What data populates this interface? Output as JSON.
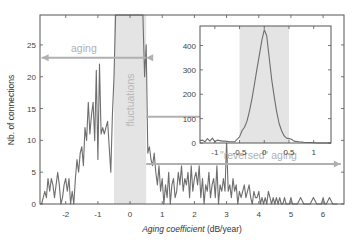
{
  "chart_data": [
    {
      "type": "line",
      "title": "",
      "xlabel": "Aging coefficient (dB/year)",
      "xlabel_italic_part": "Aging coefficient",
      "xlabel_unit_part": "(dB/year)",
      "ylabel": "Nb. of connections",
      "xlim": [
        -2.8,
        6.65
      ],
      "ylim": [
        0,
        29.7
      ],
      "xticks": [
        -2,
        -1,
        0,
        1,
        2,
        3,
        4,
        5,
        6
      ],
      "yticks": [
        0,
        5,
        10,
        15,
        20,
        25
      ],
      "grid": false,
      "line_color": "#6e6e6e",
      "shaded_region": {
        "x0": -0.5,
        "x1": 0.5,
        "color": "#e4e4e4",
        "label": "fluctuations"
      },
      "annotations": [
        {
          "text": "aging",
          "arrow": "left",
          "x_from": 0.5,
          "x_to": -2.75,
          "y": 23,
          "color": "#b0b0b0"
        },
        {
          "text": "\"reversed\" aging",
          "arrow": "right",
          "x_from": 0.5,
          "x_to": 6.55,
          "y": 6.3,
          "color": "#b0b0b0"
        },
        {
          "text": "",
          "arrow": "right-to-inset",
          "x_from": 0.5,
          "x_to": 2.95,
          "y": 13.7,
          "color": "#b0b0b0"
        }
      ],
      "series": [
        {
          "name": "Nb. of connections",
          "x": [
            -2.75,
            -2.7,
            -2.65,
            -2.6,
            -2.55,
            -2.5,
            -2.45,
            -2.4,
            -2.35,
            -2.3,
            -2.25,
            -2.2,
            -2.15,
            -2.1,
            -2.05,
            -2.0,
            -1.95,
            -1.9,
            -1.85,
            -1.8,
            -1.75,
            -1.7,
            -1.65,
            -1.6,
            -1.55,
            -1.5,
            -1.45,
            -1.4,
            -1.35,
            -1.3,
            -1.25,
            -1.2,
            -1.15,
            -1.1,
            -1.05,
            -1.0,
            -0.95,
            -0.9,
            -0.85,
            -0.8,
            -0.75,
            -0.7,
            -0.65,
            -0.6,
            -0.55,
            -0.5,
            -0.45,
            -0.4,
            -0.3,
            -0.2,
            -0.1,
            0.0,
            0.1,
            0.2,
            0.3,
            0.4,
            0.45,
            0.5,
            0.55,
            0.6,
            0.65,
            0.7,
            0.75,
            0.8,
            0.85,
            0.9,
            0.95,
            1.0,
            1.05,
            1.1,
            1.15,
            1.2,
            1.25,
            1.3,
            1.35,
            1.4,
            1.45,
            1.5,
            1.55,
            1.6,
            1.65,
            1.7,
            1.75,
            1.8,
            1.85,
            1.9,
            1.95,
            2.0,
            2.05,
            2.1,
            2.15,
            2.2,
            2.25,
            2.3,
            2.35,
            2.4,
            2.45,
            2.5,
            2.55,
            2.6,
            2.65,
            2.7,
            2.75,
            2.8,
            2.85,
            2.9,
            2.95,
            3.0,
            3.05,
            3.1,
            3.15,
            3.2,
            3.25,
            3.3,
            3.35,
            3.4,
            3.45,
            3.5,
            3.55,
            3.6,
            3.65,
            3.7,
            3.75,
            3.8,
            3.85,
            3.9,
            3.95,
            4.0,
            4.05,
            4.1,
            4.15,
            4.2,
            4.25,
            4.3,
            4.35,
            4.4,
            4.45,
            4.5,
            4.55,
            4.6,
            4.65,
            4.7,
            4.75,
            4.8,
            4.85,
            4.9,
            4.95,
            5.0,
            5.05,
            5.1,
            5.2,
            5.3,
            5.4,
            5.5,
            5.55,
            5.6,
            5.7,
            5.8,
            5.9,
            5.95,
            6.0,
            6.05,
            6.1,
            6.2,
            6.3,
            6.4,
            6.45,
            6.5
          ],
          "values": [
            0,
            1,
            2,
            1,
            4,
            2,
            4,
            3,
            1,
            3,
            5,
            3,
            0,
            1,
            3,
            4,
            2,
            4,
            0,
            2,
            0,
            4,
            7,
            5,
            8,
            9,
            6,
            12,
            10,
            16,
            11,
            14,
            16,
            10,
            21,
            7,
            22,
            11,
            12,
            11,
            12,
            13,
            9,
            5,
            14,
            20,
            30,
            30,
            30,
            30,
            30,
            30,
            30,
            30,
            30,
            30,
            20,
            25,
            8,
            9,
            7,
            6,
            8,
            5,
            3,
            6,
            2,
            4,
            0,
            3,
            1,
            5,
            0,
            3,
            4,
            1,
            2,
            5,
            3,
            6,
            2,
            4,
            3,
            5,
            1,
            6,
            2,
            4,
            5,
            3,
            6,
            1,
            4,
            0,
            3,
            2,
            5,
            1,
            3,
            4,
            1,
            6,
            0,
            3,
            2,
            4,
            2,
            10,
            2,
            3,
            1,
            4,
            2,
            3,
            0,
            2,
            1,
            2,
            3,
            1,
            2,
            3,
            1,
            0,
            2,
            1,
            1,
            2,
            0,
            1,
            0,
            1,
            0,
            2,
            1,
            0,
            1,
            0,
            1,
            0,
            1,
            0,
            0,
            1,
            0,
            0,
            0,
            1,
            0,
            0,
            0,
            1,
            0,
            0,
            0,
            0,
            1,
            0,
            0,
            0,
            1,
            0,
            0,
            1,
            0,
            0,
            0
          ]
        }
      ]
    },
    {
      "type": "line",
      "title": "inset",
      "xlabel": "",
      "ylabel": "",
      "xlim": [
        -1.3,
        1.35
      ],
      "ylim": [
        0,
        480
      ],
      "xticks": [
        -1,
        -0.5,
        0,
        0.5,
        1
      ],
      "xtick_labels": [
        "-1",
        "-0.5",
        "0",
        "0.5",
        "1"
      ],
      "yticks": [
        0,
        100,
        200,
        300,
        400
      ],
      "grid": false,
      "line_color": "#6e6e6e",
      "shaded_region": {
        "x0": -0.5,
        "x1": 0.5,
        "color": "#e4e4e4"
      },
      "series": [
        {
          "name": "Nb. of connections (zoom)",
          "x": [
            -1.3,
            -1.25,
            -1.2,
            -1.15,
            -1.1,
            -1.05,
            -1.0,
            -0.95,
            -0.9,
            -0.85,
            -0.8,
            -0.7,
            -0.6,
            -0.55,
            -0.5,
            -0.45,
            -0.4,
            -0.35,
            -0.3,
            -0.25,
            -0.2,
            -0.15,
            -0.1,
            -0.05,
            0.0,
            0.05,
            0.1,
            0.15,
            0.2,
            0.25,
            0.3,
            0.35,
            0.4,
            0.45,
            0.5,
            0.55,
            0.6,
            0.7,
            0.8,
            0.9,
            1.0,
            1.1,
            1.2,
            1.35
          ],
          "values": [
            10,
            12,
            5,
            18,
            8,
            20,
            5,
            12,
            10,
            8,
            8,
            5,
            5,
            15,
            25,
            50,
            65,
            90,
            130,
            180,
            240,
            300,
            360,
            420,
            465,
            440,
            350,
            260,
            190,
            130,
            80,
            50,
            30,
            20,
            18,
            15,
            8,
            5,
            3,
            2,
            1,
            0,
            0,
            0
          ]
        }
      ]
    }
  ],
  "labels": {
    "ylabel": "Nb. of connections",
    "xlabel_italic": "Aging coefficient",
    "xlabel_unit": " (dB/year)",
    "aging": "aging",
    "fluctuations": "fluctuations",
    "reversed_aging": "\"reversed\" aging"
  },
  "colors": {
    "line": "#6e6e6e",
    "axis": "#555555",
    "shade": "#e4e4e4",
    "annotation": "#b0b0b0"
  }
}
